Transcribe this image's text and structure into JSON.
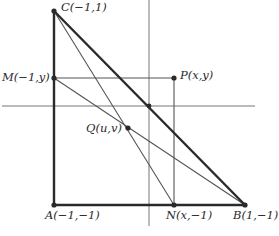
{
  "diagram": {
    "type": "geometry-figure",
    "colors": {
      "background": "#ffffff",
      "thick_line": "#2a2a2a",
      "thin_line": "#555555",
      "axis": "#777777",
      "text": "#2a2a2a"
    },
    "axes": {
      "horizontal": {
        "x1": 2,
        "y1": 106,
        "x2": 255,
        "y2": 106
      },
      "vertical": {
        "x1": 149,
        "y1": 0,
        "x2": 149,
        "y2": 226
      }
    },
    "points": {
      "C": {
        "label": "C(−1,1)",
        "px": 54,
        "py": 11
      },
      "A": {
        "label": "A(−1,−1)",
        "px": 54,
        "py": 205
      },
      "B": {
        "label": "B(1,−1)",
        "px": 245,
        "py": 205
      },
      "M": {
        "label": "M(−1,y)",
        "px": 54,
        "py": 78
      },
      "P": {
        "label": "P(x,y)",
        "px": 174,
        "py": 78
      },
      "N": {
        "label": "N(x,−1)",
        "px": 174,
        "py": 205
      },
      "Q": {
        "label": "Q(u,v)",
        "px": 128,
        "py": 128
      },
      "O": {
        "label": "",
        "px": 149,
        "py": 106
      }
    },
    "segments": [
      {
        "from": "C",
        "to": "A",
        "weight": "thick"
      },
      {
        "from": "A",
        "to": "B",
        "weight": "thick"
      },
      {
        "from": "C",
        "to": "B",
        "weight": "thick"
      },
      {
        "from": "M",
        "to": "P",
        "weight": "thin"
      },
      {
        "from": "P",
        "to": "N",
        "weight": "thin"
      },
      {
        "from": "C",
        "to": "N",
        "weight": "thin"
      },
      {
        "from": "M",
        "to": "B",
        "weight": "thin"
      }
    ],
    "labels": {
      "C": "C(−1,1)",
      "A": "A(−1,−1)",
      "B": "B(1,−1)",
      "M": "M(−1,y)",
      "P": "P(x,y)",
      "N": "N(x,−1)",
      "Q": "Q(u,v)"
    }
  }
}
